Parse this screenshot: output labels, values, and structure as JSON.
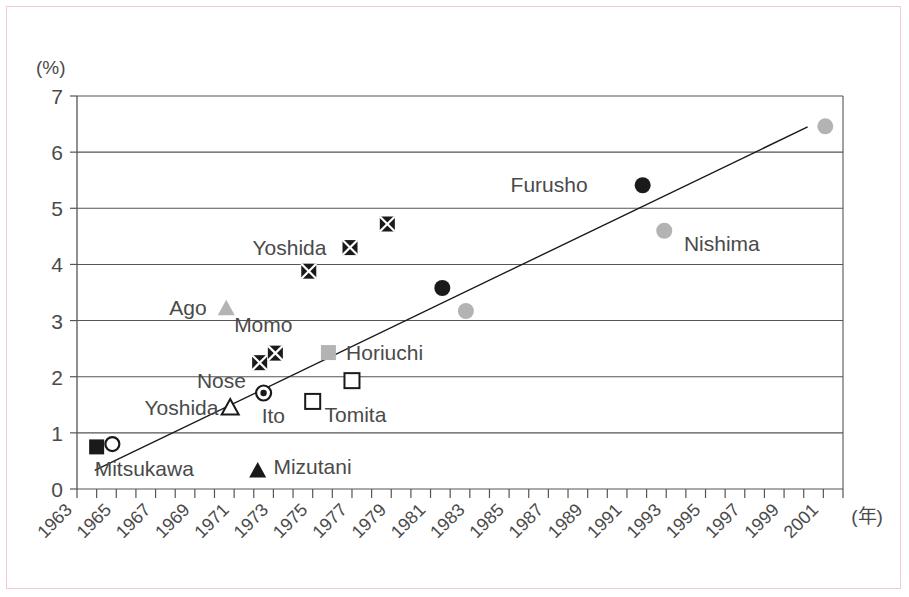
{
  "figure": {
    "y_axis_unit": "(%)",
    "x_axis_unit": "(年)"
  },
  "chart_data": {
    "type": "scatter",
    "title": "",
    "xlabel": "(年)",
    "ylabel": "(%)",
    "xlim": [
      1963,
      2002
    ],
    "ylim": [
      0,
      7
    ],
    "grid": "horizontal",
    "legend": "none",
    "y_ticks": [
      "0",
      "1",
      "2",
      "3",
      "4",
      "5",
      "6",
      "7"
    ],
    "y_tick_values": [
      0,
      1,
      2,
      3,
      4,
      5,
      6,
      7
    ],
    "x_ticks": [
      "1963",
      "1965",
      "1967",
      "1969",
      "1971",
      "1973",
      "1975",
      "1977",
      "1979",
      "1981",
      "1983",
      "1985",
      "1987",
      "1989",
      "1991",
      "1993",
      "1995",
      "1997",
      "1999",
      "2001"
    ],
    "x_tick_values": [
      1963,
      1965,
      1967,
      1969,
      1971,
      1973,
      1975,
      1977,
      1979,
      1981,
      1983,
      1985,
      1987,
      1989,
      1991,
      1993,
      1995,
      1997,
      1999,
      2001
    ],
    "trend_line": {
      "x0": 1963.9,
      "y0": 0.33,
      "x1": 2000.2,
      "y1": 6.45
    },
    "points": [
      {
        "label": "Mitsukawa",
        "marker": "filled-square",
        "color": "#1a1a1a",
        "x": 1964.0,
        "y": 0.75
      },
      {
        "label": "",
        "marker": "open-circle",
        "color": "#1a1a1a",
        "x": 1964.8,
        "y": 0.8
      },
      {
        "label": "Mizutani",
        "marker": "filled-triangle",
        "color": "#1a1a1a",
        "x": 1972.2,
        "y": 0.33
      },
      {
        "label": "Yoshida",
        "marker": "open-triangle",
        "color": "#1a1a1a",
        "x": 1970.8,
        "y": 1.45
      },
      {
        "label": "Nose",
        "marker": "circle-dot",
        "color": "#1a1a1a",
        "x": 1972.5,
        "y": 1.71
      },
      {
        "label": "Ito",
        "marker": "open-square",
        "color": "#1a1a1a",
        "x": 1975.0,
        "y": 1.56
      },
      {
        "label": "Tomita",
        "marker": "open-square",
        "color": "#1a1a1a",
        "x": 1977.0,
        "y": 1.93
      },
      {
        "label": "Ago",
        "marker": "gray-triangle",
        "color": "#b3b3b3",
        "x": 1970.6,
        "y": 3.22
      },
      {
        "label": "Momo",
        "marker": "crossed-square",
        "color": "#1a1a1a",
        "x": 1972.3,
        "y": 2.25
      },
      {
        "label": "",
        "marker": "crossed-square",
        "color": "#1a1a1a",
        "x": 1973.1,
        "y": 2.42
      },
      {
        "label": "Horiuchi",
        "marker": "gray-square",
        "color": "#b3b3b3",
        "x": 1975.8,
        "y": 2.43
      },
      {
        "label": "",
        "marker": "crossed-square",
        "color": "#1a1a1a",
        "x": 1974.8,
        "y": 3.88
      },
      {
        "label": "Yoshida",
        "marker": "crossed-square",
        "color": "#1a1a1a",
        "x": 1976.9,
        "y": 4.3
      },
      {
        "label": "",
        "marker": "crossed-square",
        "color": "#1a1a1a",
        "x": 1978.8,
        "y": 4.72
      },
      {
        "label": "",
        "marker": "filled-circle",
        "color": "#1a1a1a",
        "x": 1981.6,
        "y": 3.58
      },
      {
        "label": "",
        "marker": "gray-circle",
        "color": "#b3b3b3",
        "x": 1982.8,
        "y": 3.17
      },
      {
        "label": "Furusho",
        "marker": "filled-circle",
        "color": "#1a1a1a",
        "x": 1991.8,
        "y": 5.41
      },
      {
        "label": "Nishima",
        "marker": "gray-circle",
        "color": "#b3b3b3",
        "x": 1992.9,
        "y": 4.6
      },
      {
        "label": "",
        "marker": "gray-circle",
        "color": "#b3b3b3",
        "x": 2001.1,
        "y": 6.46
      }
    ],
    "point_labels": [
      {
        "text": "Furusho",
        "x": 1989.0,
        "y": 5.42,
        "anchor": "end"
      },
      {
        "text": "Nishima",
        "x": 1993.9,
        "y": 4.37,
        "anchor": "start"
      },
      {
        "text": "Yoshida",
        "x": 1975.7,
        "y": 4.3,
        "anchor": "end"
      },
      {
        "text": "Ago",
        "x": 1969.6,
        "y": 3.23,
        "anchor": "end"
      },
      {
        "text": "Momo",
        "x": 1971.0,
        "y": 2.92,
        "anchor": "start"
      },
      {
        "text": "Horiuchi",
        "x": 1976.7,
        "y": 2.42,
        "anchor": "start"
      },
      {
        "text": "Nose",
        "x": 1971.6,
        "y": 1.92,
        "anchor": "end"
      },
      {
        "text": "Ito",
        "x": 1972.4,
        "y": 1.3,
        "anchor": "start"
      },
      {
        "text": "Yoshida",
        "x": 1970.2,
        "y": 1.45,
        "anchor": "end"
      },
      {
        "text": "Tomita",
        "x": 1975.6,
        "y": 1.32,
        "anchor": "start"
      },
      {
        "text": "Mitsukawa",
        "x": 1963.9,
        "y": 0.35,
        "anchor": "start"
      },
      {
        "text": "Mizutani",
        "x": 1973.0,
        "y": 0.4,
        "anchor": "start"
      }
    ]
  }
}
